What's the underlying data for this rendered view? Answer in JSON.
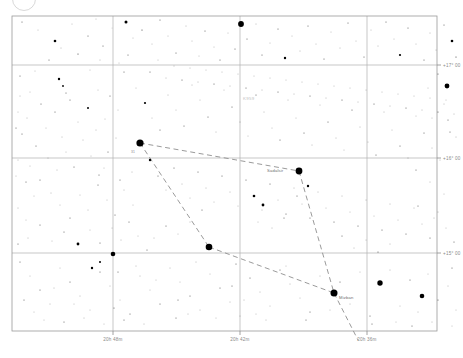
{
  "chart_data": {
    "type": "scatter",
    "title": "",
    "xlabel": "",
    "ylabel": "",
    "grid": true,
    "legend_position": "none",
    "projection": "equatorial",
    "xlim": [
      20.6,
      20.85
    ],
    "ylim": [
      14.55,
      17.3
    ],
    "x_axis": {
      "name": "Right Ascension",
      "direction": "decreasing-right",
      "ticks": [
        {
          "value": "20h 48m",
          "px": 113
        },
        {
          "value": "20h 42m",
          "px": 240
        },
        {
          "value": "20h 36m",
          "px": 367
        }
      ]
    },
    "y_axis": {
      "name": "Declination",
      "ticks": [
        {
          "value": "+17° 00",
          "px": 65
        },
        {
          "value": "+16° 00",
          "px": 158
        },
        {
          "value": "+15° 00",
          "px": 253
        }
      ]
    },
    "annotations": [
      {
        "text": "K959",
        "x": 243,
        "y": 100,
        "style": "faint"
      },
      {
        "text": "Sadalsir",
        "x": 267,
        "y": 172,
        "style": "normal"
      },
      {
        "text": "Mizban",
        "x": 339,
        "y": 299,
        "style": "normal"
      },
      {
        "text": "31",
        "x": 131,
        "y": 153,
        "style": "tiny"
      }
    ],
    "constellation_lines": [
      {
        "from": [
          140,
          143
        ],
        "to": [
          299,
          171
        ]
      },
      {
        "from": [
          140,
          143
        ],
        "to": [
          209,
          247
        ]
      },
      {
        "from": [
          209,
          247
        ],
        "to": [
          334,
          293
        ]
      },
      {
        "from": [
          299,
          171
        ],
        "to": [
          334,
          293
        ]
      },
      {
        "from": [
          334,
          293
        ],
        "to": [
          358,
          340
        ]
      }
    ],
    "bright_stars": [
      {
        "x": 140,
        "y": 143,
        "r": 3.6
      },
      {
        "x": 299,
        "y": 171,
        "r": 3.4
      },
      {
        "x": 209,
        "y": 247,
        "r": 3.3
      },
      {
        "x": 334,
        "y": 293,
        "r": 3.5
      },
      {
        "x": 241,
        "y": 24,
        "r": 2.9
      },
      {
        "x": 113,
        "y": 254,
        "r": 2.3
      },
      {
        "x": 380,
        "y": 283,
        "r": 2.7
      },
      {
        "x": 447,
        "y": 86,
        "r": 2.4
      },
      {
        "x": 422,
        "y": 296,
        "r": 2.3
      }
    ],
    "star_count_visible": 300
  },
  "chart": {
    "plot_area": {
      "left": 12,
      "top": 16,
      "width": 425,
      "height": 315
    },
    "background_color": "#ffffff",
    "grid_color": "#b0b0b0",
    "star_color": "#000000",
    "line_color": "#8f8f8f",
    "label_color": "#8a8a8a"
  },
  "stars": [
    [
      22,
      22,
      0.5
    ],
    [
      38,
      30,
      0.4
    ],
    [
      55,
      41,
      1.3
    ],
    [
      49,
      60,
      0.5
    ],
    [
      72,
      24,
      0.4
    ],
    [
      88,
      36,
      0.5
    ],
    [
      96,
      19,
      0.4
    ],
    [
      61,
      48,
      0.45
    ],
    [
      78,
      54,
      0.6
    ],
    [
      103,
      46,
      0.5
    ],
    [
      112,
      28,
      0.35
    ],
    [
      35,
      71,
      0.4
    ],
    [
      59,
      79,
      1.2
    ],
    [
      63,
      86,
      0.9
    ],
    [
      66,
      93,
      0.5
    ],
    [
      90,
      70,
      0.4
    ],
    [
      98,
      90,
      0.4
    ],
    [
      100,
      60,
      0.45
    ],
    [
      119,
      63,
      0.4
    ],
    [
      126,
      22,
      1.5
    ],
    [
      133,
      38,
      0.4
    ],
    [
      128,
      55,
      0.5
    ],
    [
      142,
      30,
      0.6
    ],
    [
      152,
      44,
      0.4
    ],
    [
      160,
      20,
      0.5
    ],
    [
      168,
      36,
      0.4
    ],
    [
      176,
      53,
      0.5
    ],
    [
      186,
      26,
      0.45
    ],
    [
      192,
      41,
      0.4
    ],
    [
      199,
      56,
      0.4
    ],
    [
      205,
      31,
      0.5
    ],
    [
      214,
      47,
      0.4
    ],
    [
      220,
      60,
      0.5
    ],
    [
      228,
      33,
      0.4
    ],
    [
      235,
      49,
      0.5
    ],
    [
      247,
      39,
      0.5
    ],
    [
      256,
      24,
      0.45
    ],
    [
      262,
      55,
      0.5
    ],
    [
      270,
      43,
      0.4
    ],
    [
      278,
      29,
      0.5
    ],
    [
      285,
      58,
      1.2
    ],
    [
      292,
      36,
      0.4
    ],
    [
      300,
      51,
      0.45
    ],
    [
      308,
      26,
      0.5
    ],
    [
      316,
      44,
      0.4
    ],
    [
      324,
      59,
      0.5
    ],
    [
      331,
      32,
      0.4
    ],
    [
      340,
      48,
      0.45
    ],
    [
      348,
      23,
      0.5
    ],
    [
      356,
      41,
      0.4
    ],
    [
      364,
      57,
      0.5
    ],
    [
      371,
      30,
      0.4
    ],
    [
      378,
      46,
      0.45
    ],
    [
      386,
      22,
      0.5
    ],
    [
      394,
      39,
      0.4
    ],
    [
      400,
      55,
      1.1
    ],
    [
      408,
      28,
      0.5
    ],
    [
      416,
      44,
      0.4
    ],
    [
      424,
      60,
      0.5
    ],
    [
      430,
      33,
      0.45
    ],
    [
      436,
      50,
      0.4
    ],
    [
      444,
      25,
      0.5
    ],
    [
      452,
      41,
      1.3
    ],
    [
      456,
      57,
      0.6
    ],
    [
      20,
      76,
      0.5
    ],
    [
      30,
      92,
      0.4
    ],
    [
      41,
      104,
      0.5
    ],
    [
      27,
      118,
      0.45
    ],
    [
      46,
      128,
      0.4
    ],
    [
      55,
      112,
      0.5
    ],
    [
      62,
      137,
      0.45
    ],
    [
      70,
      100,
      0.5
    ],
    [
      78,
      122,
      0.4
    ],
    [
      36,
      146,
      0.5
    ],
    [
      48,
      158,
      0.4
    ],
    [
      57,
      170,
      0.45
    ],
    [
      66,
      152,
      0.4
    ],
    [
      74,
      167,
      0.5
    ],
    [
      83,
      140,
      0.45
    ],
    [
      91,
      156,
      0.4
    ],
    [
      99,
      175,
      0.5
    ],
    [
      88,
      108,
      1.0
    ],
    [
      105,
      119,
      0.4
    ],
    [
      110,
      96,
      0.5
    ],
    [
      118,
      110,
      0.4
    ],
    [
      96,
      130,
      0.45
    ],
    [
      22,
      134,
      0.5
    ],
    [
      30,
      166,
      0.4
    ],
    [
      40,
      180,
      0.5
    ],
    [
      51,
      193,
      0.45
    ],
    [
      60,
      205,
      0.4
    ],
    [
      70,
      218,
      0.5
    ],
    [
      80,
      195,
      0.4
    ],
    [
      88,
      210,
      0.45
    ],
    [
      98,
      185,
      0.5
    ],
    [
      107,
      200,
      0.4
    ],
    [
      115,
      215,
      0.5
    ],
    [
      124,
      190,
      0.45
    ],
    [
      133,
      205,
      0.4
    ],
    [
      78,
      244,
      1.4
    ],
    [
      64,
      232,
      0.5
    ],
    [
      52,
      241,
      0.4
    ],
    [
      40,
      225,
      0.5
    ],
    [
      28,
      238,
      0.45
    ],
    [
      90,
      230,
      0.4
    ],
    [
      100,
      243,
      0.5
    ],
    [
      112,
      228,
      0.4
    ],
    [
      121,
      240,
      0.45
    ],
    [
      129,
      222,
      0.5
    ],
    [
      138,
      236,
      0.4
    ],
    [
      147,
      250,
      0.5
    ],
    [
      124,
      72,
      0.5
    ],
    [
      136,
      88,
      0.4
    ],
    [
      145,
      103,
      1.1
    ],
    [
      152,
      118,
      0.4
    ],
    [
      160,
      130,
      0.5
    ],
    [
      168,
      95,
      0.45
    ],
    [
      176,
      110,
      0.4
    ],
    [
      184,
      126,
      0.5
    ],
    [
      192,
      85,
      0.45
    ],
    [
      200,
      100,
      0.4
    ],
    [
      208,
      117,
      0.5
    ],
    [
      216,
      132,
      0.45
    ],
    [
      224,
      90,
      0.4
    ],
    [
      232,
      107,
      0.5
    ],
    [
      240,
      122,
      0.45
    ],
    [
      248,
      136,
      0.4
    ],
    [
      256,
      95,
      0.5
    ],
    [
      264,
      112,
      0.45
    ],
    [
      272,
      128,
      0.4
    ],
    [
      280,
      140,
      0.5
    ],
    [
      288,
      100,
      0.45
    ],
    [
      296,
      118,
      0.4
    ],
    [
      304,
      133,
      0.5
    ],
    [
      312,
      145,
      0.45
    ],
    [
      320,
      105,
      0.4
    ],
    [
      328,
      122,
      0.5
    ],
    [
      336,
      138,
      0.45
    ],
    [
      344,
      150,
      0.4
    ],
    [
      352,
      110,
      0.5
    ],
    [
      360,
      127,
      0.45
    ],
    [
      368,
      142,
      0.4
    ],
    [
      376,
      155,
      0.5
    ],
    [
      384,
      112,
      0.45
    ],
    [
      392,
      130,
      0.4
    ],
    [
      400,
      146,
      0.5
    ],
    [
      408,
      158,
      0.45
    ],
    [
      416,
      116,
      0.4
    ],
    [
      424,
      133,
      0.5
    ],
    [
      432,
      148,
      0.45
    ],
    [
      440,
      160,
      0.4
    ],
    [
      448,
      120,
      0.5
    ],
    [
      456,
      137,
      0.45
    ],
    [
      150,
      72,
      0.5
    ],
    [
      158,
      60,
      0.4
    ],
    [
      166,
      78,
      0.45
    ],
    [
      174,
      66,
      0.4
    ],
    [
      182,
      80,
      0.5
    ],
    [
      190,
      68,
      0.4
    ],
    [
      198,
      82,
      0.45
    ],
    [
      206,
      70,
      0.4
    ],
    [
      214,
      84,
      0.5
    ],
    [
      222,
      72,
      0.4
    ],
    [
      230,
      86,
      0.45
    ],
    [
      238,
      74,
      0.4
    ],
    [
      246,
      88,
      0.5
    ],
    [
      254,
      76,
      0.4
    ],
    [
      262,
      90,
      0.45
    ],
    [
      270,
      78,
      0.4
    ],
    [
      278,
      92,
      0.5
    ],
    [
      286,
      80,
      0.4
    ],
    [
      294,
      94,
      0.45
    ],
    [
      302,
      82,
      0.4
    ],
    [
      310,
      96,
      0.5
    ],
    [
      318,
      84,
      0.4
    ],
    [
      326,
      98,
      0.45
    ],
    [
      334,
      86,
      0.4
    ],
    [
      342,
      100,
      0.5
    ],
    [
      350,
      88,
      0.4
    ],
    [
      358,
      102,
      0.45
    ],
    [
      366,
      90,
      0.4
    ],
    [
      374,
      104,
      0.5
    ],
    [
      382,
      92,
      0.4
    ],
    [
      390,
      106,
      0.45
    ],
    [
      398,
      94,
      0.4
    ],
    [
      406,
      108,
      0.5
    ],
    [
      414,
      96,
      0.4
    ],
    [
      422,
      110,
      0.45
    ],
    [
      430,
      98,
      0.4
    ],
    [
      438,
      112,
      0.5
    ],
    [
      446,
      100,
      0.4
    ],
    [
      454,
      114,
      0.45
    ],
    [
      150,
      160,
      1.2
    ],
    [
      158,
      176,
      0.5
    ],
    [
      166,
      190,
      0.4
    ],
    [
      174,
      168,
      0.5
    ],
    [
      182,
      184,
      0.45
    ],
    [
      190,
      198,
      0.4
    ],
    [
      198,
      172,
      0.5
    ],
    [
      206,
      188,
      0.45
    ],
    [
      214,
      202,
      0.4
    ],
    [
      222,
      176,
      0.5
    ],
    [
      230,
      192,
      0.45
    ],
    [
      238,
      206,
      0.4
    ],
    [
      246,
      180,
      0.5
    ],
    [
      254,
      196,
      1.3
    ],
    [
      262,
      210,
      0.45
    ],
    [
      270,
      184,
      0.5
    ],
    [
      278,
      200,
      0.4
    ],
    [
      286,
      214,
      0.5
    ],
    [
      294,
      188,
      0.45
    ],
    [
      263,
      205,
      1.4
    ],
    [
      302,
      204,
      0.4
    ],
    [
      310,
      218,
      0.5
    ],
    [
      318,
      192,
      0.45
    ],
    [
      326,
      208,
      0.4
    ],
    [
      334,
      222,
      0.5
    ],
    [
      342,
      196,
      0.45
    ],
    [
      350,
      212,
      0.4
    ],
    [
      358,
      226,
      0.5
    ],
    [
      366,
      200,
      0.45
    ],
    [
      374,
      216,
      0.4
    ],
    [
      382,
      230,
      0.5
    ],
    [
      390,
      204,
      0.45
    ],
    [
      398,
      220,
      0.4
    ],
    [
      406,
      234,
      0.5
    ],
    [
      414,
      208,
      0.45
    ],
    [
      422,
      224,
      0.4
    ],
    [
      430,
      238,
      0.5
    ],
    [
      438,
      212,
      0.45
    ],
    [
      446,
      228,
      0.4
    ],
    [
      454,
      242,
      0.5
    ],
    [
      308,
      186,
      1.2
    ],
    [
      297,
      196,
      0.5
    ],
    [
      284,
      218,
      0.5
    ],
    [
      272,
      228,
      0.45
    ],
    [
      258,
      222,
      0.4
    ],
    [
      20,
      262,
      0.5
    ],
    [
      30,
      276,
      0.4
    ],
    [
      40,
      290,
      0.5
    ],
    [
      50,
      304,
      0.45
    ],
    [
      60,
      268,
      0.4
    ],
    [
      70,
      282,
      0.5
    ],
    [
      80,
      296,
      0.45
    ],
    [
      90,
      310,
      0.4
    ],
    [
      100,
      272,
      0.5
    ],
    [
      110,
      286,
      0.45
    ],
    [
      120,
      300,
      0.4
    ],
    [
      130,
      314,
      0.5
    ],
    [
      140,
      276,
      0.45
    ],
    [
      150,
      290,
      0.4
    ],
    [
      160,
      304,
      0.5
    ],
    [
      170,
      268,
      0.45
    ],
    [
      180,
      282,
      0.4
    ],
    [
      190,
      296,
      0.5
    ],
    [
      200,
      310,
      0.45
    ],
    [
      210,
      274,
      0.4
    ],
    [
      220,
      288,
      0.5
    ],
    [
      230,
      302,
      0.45
    ],
    [
      240,
      316,
      0.4
    ],
    [
      250,
      278,
      0.5
    ],
    [
      260,
      292,
      0.45
    ],
    [
      270,
      306,
      0.4
    ],
    [
      280,
      270,
      0.5
    ],
    [
      290,
      284,
      0.45
    ],
    [
      300,
      298,
      0.4
    ],
    [
      310,
      312,
      0.5
    ],
    [
      320,
      276,
      0.45
    ],
    [
      330,
      310,
      0.4
    ],
    [
      340,
      282,
      0.5
    ],
    [
      350,
      304,
      0.45
    ],
    [
      360,
      272,
      0.4
    ],
    [
      370,
      316,
      0.5
    ],
    [
      390,
      270,
      0.45
    ],
    [
      400,
      306,
      0.4
    ],
    [
      410,
      280,
      0.5
    ],
    [
      418,
      312,
      0.45
    ],
    [
      428,
      274,
      0.4
    ],
    [
      438,
      300,
      0.5
    ],
    [
      448,
      286,
      0.45
    ],
    [
      456,
      310,
      0.4
    ],
    [
      452,
      268,
      0.5
    ],
    [
      92,
      268,
      1.2
    ],
    [
      100,
      262,
      1.0
    ],
    [
      118,
      272,
      0.5
    ],
    [
      136,
      266,
      0.45
    ],
    [
      156,
      280,
      0.4
    ],
    [
      176,
      318,
      0.5
    ],
    [
      196,
      262,
      0.45
    ],
    [
      216,
      318,
      0.4
    ],
    [
      236,
      264,
      0.5
    ],
    [
      266,
      320,
      0.45
    ],
    [
      286,
      266,
      0.4
    ],
    [
      306,
      320,
      0.5
    ],
    [
      232,
      286,
      0.5
    ],
    [
      244,
      300,
      0.45
    ],
    [
      256,
      314,
      0.4
    ],
    [
      178,
      300,
      0.5
    ],
    [
      188,
      314,
      0.45
    ],
    [
      44,
      320,
      0.4
    ],
    [
      64,
      322,
      0.5
    ],
    [
      84,
      318,
      0.45
    ],
    [
      104,
      324,
      0.4
    ],
    [
      124,
      320,
      0.5
    ],
    [
      144,
      324,
      0.45
    ],
    [
      24,
      300,
      0.5
    ],
    [
      34,
      312,
      0.4
    ],
    [
      54,
      288,
      0.45
    ],
    [
      74,
      304,
      0.4
    ],
    [
      114,
      308,
      0.5
    ],
    [
      396,
      322,
      0.4
    ],
    [
      412,
      326,
      0.5
    ],
    [
      432,
      322,
      0.45
    ],
    [
      452,
      326,
      0.4
    ],
    [
      372,
      324,
      0.5
    ],
    [
      26,
      182,
      0.5
    ],
    [
      34,
      196,
      0.4
    ],
    [
      18,
      208,
      0.45
    ],
    [
      26,
      220,
      0.4
    ],
    [
      18,
      244,
      0.5
    ],
    [
      438,
      74,
      0.5
    ],
    [
      428,
      88,
      0.4
    ],
    [
      444,
      104,
      0.45
    ],
    [
      432,
      118,
      0.4
    ],
    [
      450,
      132,
      0.5
    ],
    [
      20,
      96,
      0.45
    ],
    [
      18,
      112,
      0.4
    ],
    [
      16,
      128,
      0.5
    ],
    [
      18,
      160,
      0.45
    ],
    [
      16,
      176,
      0.4
    ],
    [
      416,
      170,
      0.5
    ],
    [
      430,
      182,
      0.45
    ],
    [
      444,
      194,
      0.4
    ],
    [
      418,
      206,
      0.5
    ],
    [
      434,
      218,
      0.45
    ],
    [
      342,
      236,
      0.5
    ],
    [
      354,
      248,
      0.45
    ],
    [
      366,
      240,
      0.4
    ],
    [
      378,
      252,
      0.5
    ],
    [
      390,
      244,
      0.45
    ],
    [
      202,
      210,
      0.5
    ],
    [
      190,
      222,
      0.45
    ],
    [
      178,
      234,
      0.4
    ],
    [
      166,
      226,
      0.5
    ],
    [
      154,
      238,
      0.45
    ],
    [
      108,
      152,
      0.5
    ],
    [
      116,
      138,
      0.45
    ],
    [
      104,
      168,
      0.4
    ],
    [
      120,
      180,
      0.5
    ],
    [
      132,
      172,
      0.45
    ]
  ],
  "labels": {
    "ra_ticks": [
      "20h 48m",
      "20h 42m",
      "20h 36m"
    ],
    "dec_ticks": [
      "+17° 00",
      "+16° 00",
      "+15° 00"
    ],
    "star_names": [
      "Sadalsir",
      "Mizban",
      "K959",
      "31"
    ]
  }
}
